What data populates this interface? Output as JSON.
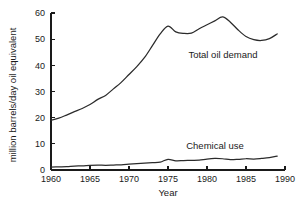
{
  "chart_data": {
    "type": "line",
    "title": "",
    "xlabel": "Year",
    "ylabel": "million barrels/day oil equivalent",
    "xlim": [
      1960,
      1990
    ],
    "ylim": [
      0,
      60
    ],
    "xticks": [
      1960,
      1965,
      1970,
      1975,
      1980,
      1985,
      1990
    ],
    "yticks": [
      0,
      10,
      20,
      30,
      40,
      50,
      60
    ],
    "grid": false,
    "legend_position": "inline-annotation",
    "x": [
      1960,
      1961,
      1962,
      1963,
      1964,
      1965,
      1966,
      1967,
      1968,
      1969,
      1970,
      1971,
      1972,
      1973,
      1974,
      1975,
      1976,
      1977,
      1978,
      1979,
      1980,
      1981,
      1982,
      1983,
      1984,
      1985,
      1986,
      1987,
      1988,
      1989
    ],
    "series": [
      {
        "name": "Total oil demand",
        "annotation": "Total oil demand",
        "values": [
          19.0,
          19.8,
          21.0,
          22.3,
          23.5,
          25.0,
          27.0,
          28.5,
          31.0,
          33.5,
          36.5,
          39.5,
          43.0,
          47.5,
          52.0,
          55.0,
          52.8,
          52.2,
          52.3,
          54.0,
          55.5,
          57.0,
          58.5,
          56.5,
          53.5,
          51.0,
          49.8,
          49.5,
          50.2,
          52.0
        ]
      },
      {
        "name": "Chemical use",
        "annotation": "Chemical use",
        "values": [
          1.1,
          1.2,
          1.3,
          1.5,
          1.6,
          1.8,
          1.9,
          1.8,
          1.9,
          2.0,
          2.2,
          2.4,
          2.6,
          2.8,
          3.0,
          4.1,
          3.5,
          3.6,
          3.7,
          3.8,
          4.2,
          4.4,
          4.3,
          4.0,
          4.1,
          4.3,
          4.2,
          4.4,
          4.7,
          5.3
        ]
      }
    ],
    "series_extra_x": [
      1989.5
    ],
    "annotations": [
      {
        "text": "Total oil demand",
        "x_frac": 0.735,
        "y_px": 58
      },
      {
        "text": "Chemical use",
        "x_frac": 0.7,
        "y_px": 149
      }
    ]
  },
  "axis": {
    "x_title": "Year",
    "y_title": "million barrels/day oil equivalent",
    "x_tick_labels": [
      "1960",
      "1965",
      "1970",
      "1975",
      "1980",
      "1985",
      "1990"
    ],
    "y_tick_labels": [
      "0",
      "10",
      "20",
      "30",
      "40",
      "50",
      "60"
    ]
  },
  "colors": {
    "line": "#2b2b2b",
    "axis": "#1a1a1a",
    "background": "#ffffff"
  }
}
